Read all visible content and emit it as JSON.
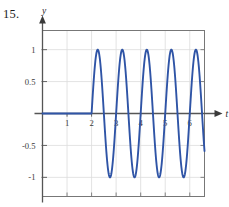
{
  "figure": {
    "problem_number": "15.",
    "background_color": "#ffffff"
  },
  "chart_data": {
    "type": "line",
    "title": "",
    "xlabel": "t",
    "ylabel": "y",
    "grid": true,
    "legend_position": "none",
    "curve_color": "#2f54a6",
    "axis_color": "#555555",
    "grid_color": "#dcdcdc",
    "frame_color": "#777777",
    "xlim": [
      0,
      6.6
    ],
    "ylim": [
      -1.3,
      1.3
    ],
    "x_ticks": [
      1,
      2,
      3,
      4,
      5,
      6
    ],
    "x_tick_labels": [
      "1",
      "2",
      "3",
      "4",
      "5",
      "6"
    ],
    "y_ticks": [
      1,
      0.5,
      -0.5,
      -1
    ],
    "y_tick_labels": [
      "1",
      "0.5",
      "-0.5",
      "-1"
    ],
    "step_time": 2,
    "amplitude": 1,
    "period": 1,
    "series": [
      {
        "name": "y(t)",
        "x": [
          0,
          0.1,
          0.2,
          0.3,
          0.4,
          0.5,
          0.6,
          0.7,
          0.8,
          0.9,
          1,
          1.1,
          1.2,
          1.3,
          1.4,
          1.5,
          1.6,
          1.7,
          1.8,
          1.9,
          2,
          2.05,
          2.1,
          2.15,
          2.2,
          2.25,
          2.3,
          2.35,
          2.4,
          2.45,
          2.5,
          2.55,
          2.6,
          2.65,
          2.7,
          2.75,
          2.8,
          2.85,
          2.9,
          2.95,
          3,
          3.05,
          3.1,
          3.15,
          3.2,
          3.25,
          3.3,
          3.35,
          3.4,
          3.45,
          3.5,
          3.55,
          3.6,
          3.65,
          3.7,
          3.75,
          3.8,
          3.85,
          3.9,
          3.95,
          4,
          4.05,
          4.1,
          4.15,
          4.2,
          4.25,
          4.3,
          4.35,
          4.4,
          4.45,
          4.5,
          4.55,
          4.6,
          4.65,
          4.7,
          4.75,
          4.8,
          4.85,
          4.9,
          4.95,
          5,
          5.05,
          5.1,
          5.15,
          5.2,
          5.25,
          5.3,
          5.35,
          5.4,
          5.45,
          5.5,
          5.55,
          5.6,
          5.65,
          5.7,
          5.75,
          5.8,
          5.85,
          5.9,
          5.95,
          6,
          6.05,
          6.1,
          6.15,
          6.2,
          6.25
        ],
        "y": [
          0,
          0,
          0,
          0,
          0,
          0,
          0,
          0,
          0,
          0,
          0,
          0,
          0,
          0,
          0,
          0,
          0,
          0,
          0,
          0,
          0,
          0.309,
          0.588,
          0.809,
          0.951,
          1,
          0.951,
          0.809,
          0.588,
          0.309,
          0,
          -0.309,
          -0.588,
          -0.809,
          -0.951,
          -1,
          -0.951,
          -0.809,
          -0.588,
          -0.309,
          0,
          0.309,
          0.588,
          0.809,
          0.951,
          1,
          0.951,
          0.809,
          0.588,
          0.309,
          0,
          -0.309,
          -0.588,
          -0.809,
          -0.951,
          -1,
          -0.951,
          -0.809,
          -0.588,
          -0.309,
          0,
          0.309,
          0.588,
          0.809,
          0.951,
          1,
          0.951,
          0.809,
          0.588,
          0.309,
          0,
          -0.309,
          -0.588,
          -0.809,
          -0.951,
          -1,
          -0.951,
          -0.809,
          -0.588,
          -0.309,
          0,
          0.309,
          0.588,
          0.809,
          0.951,
          1,
          0.951,
          0.809,
          0.588,
          0.309,
          0,
          -0.309,
          -0.588,
          -0.809,
          -0.951,
          -1,
          -0.951,
          -0.809,
          -0.588,
          -0.309,
          0,
          0.309,
          0.588,
          0.809,
          0.951,
          1
        ]
      }
    ]
  }
}
